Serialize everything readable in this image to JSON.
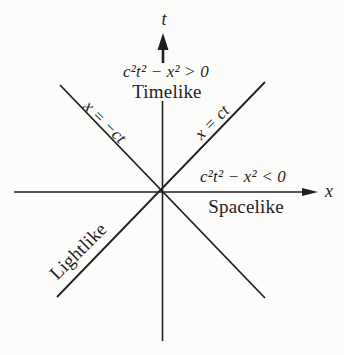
{
  "figure": {
    "axes": {
      "t_label": "t",
      "x_label": "x"
    },
    "timelike": {
      "equation": "c²t² − x² > 0",
      "label": "Timelike"
    },
    "spacelike": {
      "equation": "c²t² − x² < 0",
      "label": "Spacelike"
    },
    "lightlines": {
      "negative_label": "x = −ct",
      "positive_label": "x = ct",
      "region_label": "Lightlike"
    },
    "colors": {
      "ink": "#1f1f1f",
      "paper": "#fcfcfb"
    }
  }
}
